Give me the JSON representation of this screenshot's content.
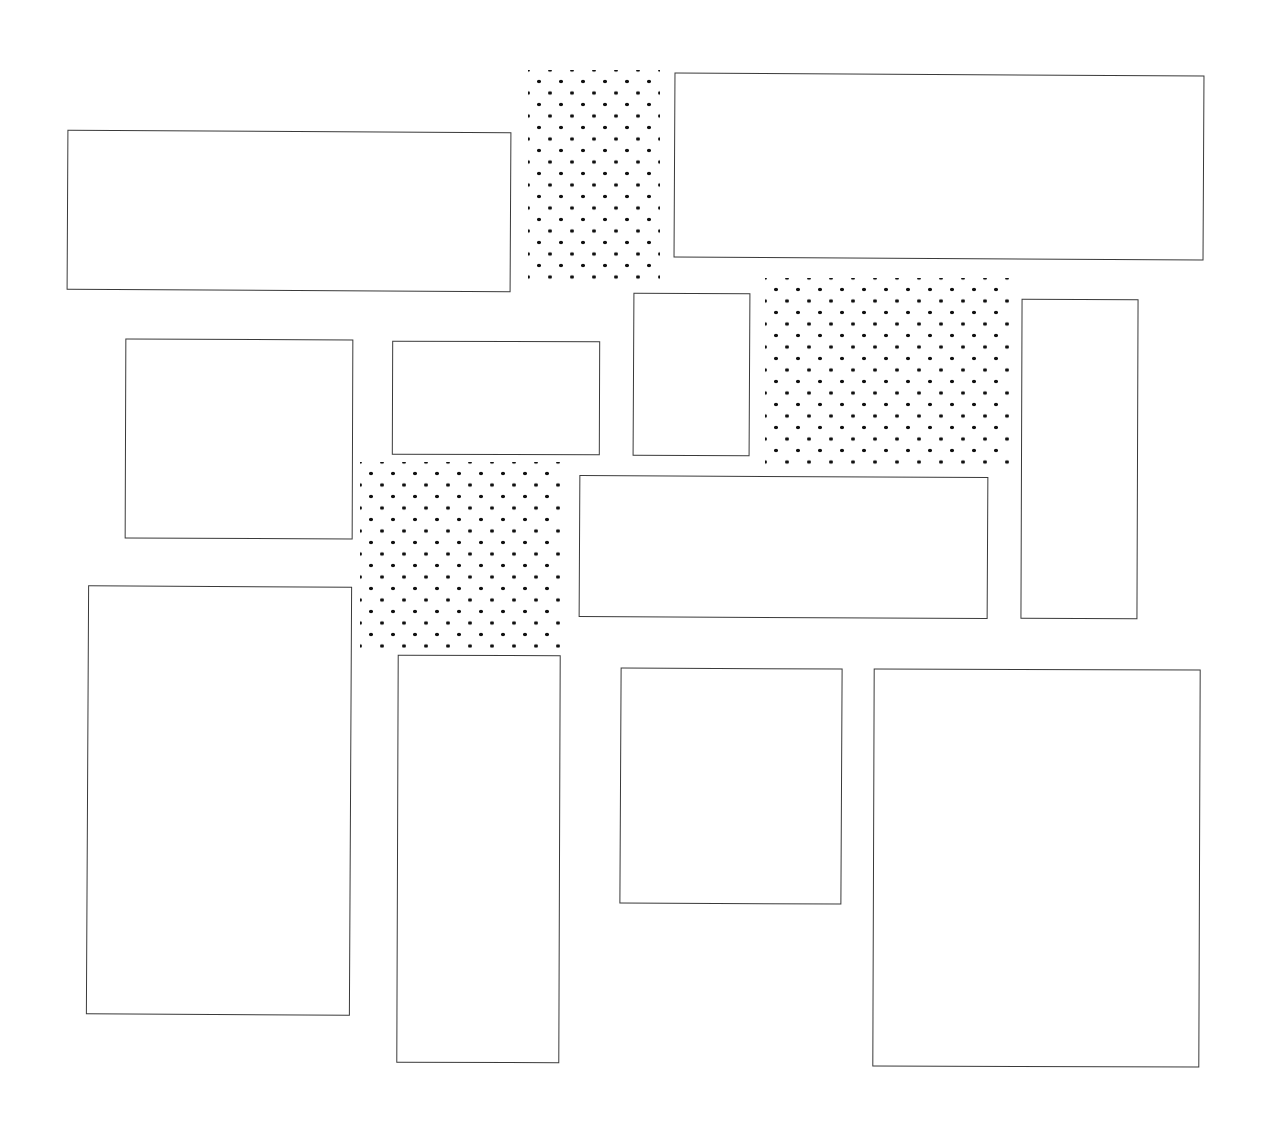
{
  "diagram": {
    "title": "",
    "background": "#ffffff",
    "stroke_color": "#3a3a3a",
    "dot_color": "#111111",
    "dotted_regions": [
      {
        "id": "dots-top",
        "x": 528,
        "y": 70,
        "w": 132,
        "h": 210
      },
      {
        "id": "dots-mid-right",
        "x": 765,
        "y": 278,
        "w": 248,
        "h": 190
      },
      {
        "id": "dots-mid-left",
        "x": 360,
        "y": 462,
        "w": 206,
        "h": 186
      }
    ],
    "rectangles": [
      {
        "id": "rect-top-left",
        "x": 67,
        "y": 131,
        "w": 444,
        "h": 160,
        "rot": 0.3
      },
      {
        "id": "rect-top-right",
        "x": 674,
        "y": 74,
        "w": 530,
        "h": 185,
        "rot": 0.3
      },
      {
        "id": "rect-mid-1",
        "x": 125,
        "y": 339,
        "w": 228,
        "h": 200,
        "rot": 0.2
      },
      {
        "id": "rect-mid-2",
        "x": 392,
        "y": 341,
        "w": 208,
        "h": 114,
        "rot": 0.2
      },
      {
        "id": "rect-mid-3",
        "x": 633,
        "y": 293,
        "w": 117,
        "h": 163,
        "rot": 0.3
      },
      {
        "id": "rect-mid-right-tall",
        "x": 1021,
        "y": 299,
        "w": 117,
        "h": 320,
        "rot": 0.2
      },
      {
        "id": "rect-center-wide",
        "x": 579,
        "y": 476,
        "w": 409,
        "h": 142,
        "rot": 0.3
      },
      {
        "id": "rect-bottom-left",
        "x": 87,
        "y": 586,
        "w": 264,
        "h": 429,
        "rot": 0.3
      },
      {
        "id": "rect-bottom-2",
        "x": 397,
        "y": 655,
        "w": 163,
        "h": 408,
        "rot": 0.2
      },
      {
        "id": "rect-bottom-3",
        "x": 620,
        "y": 668,
        "w": 222,
        "h": 236,
        "rot": 0.3
      },
      {
        "id": "rect-bottom-right",
        "x": 873,
        "y": 669,
        "w": 327,
        "h": 398,
        "rot": 0.2
      }
    ]
  }
}
